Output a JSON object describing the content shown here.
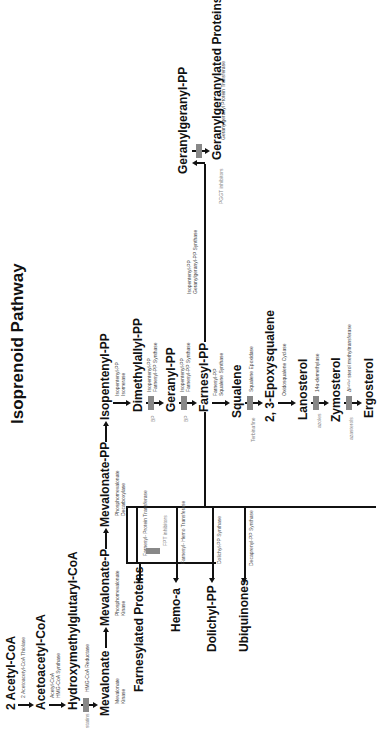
{
  "title": "Isoprenoid Pathway",
  "orientation": "rotated 90° counter-clockwise",
  "colors": {
    "text": "#111111",
    "inhibitor_text": "#888888",
    "inhibitor_block": "#888888",
    "background": "#ffffff"
  },
  "nodes": {
    "acetyl_coa": "2 Acetyl-CoA",
    "acetoacetyl_coa": "Acetoacetyl-CoA",
    "hmg_coa": "Hydroxymethylglutaryl-CoA",
    "mevalonate": "Mevalonate",
    "mevalonate_p": "Mevalonate-P",
    "mevalonate_pp": "Mevalonate-PP",
    "isopentenyl_pp": "Isopentenyl-PP",
    "dimethylallyl_pp": "Dimethylallyl-PP",
    "geranyl_pp": "Geranyl-PP",
    "farnesyl_pp": "Farnesyl-PP",
    "squalene": "Squalene",
    "epoxysqualene": "2, 3-Epoxysqualene",
    "lanosterol": "Lanosterol",
    "zymosterol": "Zymosterol",
    "ergosterol": "Ergosterol",
    "farnesylated_proteins": "Farnesylated Proteins",
    "hemo_a": "Hemo-a",
    "dolichyl_pp": "Dolichyl-PP",
    "ubiquinones": "Ubiquinones",
    "geranylgeranyl_pp": "Geranylgeranyl-PP",
    "geranylgeranylated_proteins": "Geranylgeranylated Proteins"
  },
  "enzymes": {
    "thiolase": "2 Acetoacetyl-CoA Thiolase",
    "hmg_synthase_1": "Acetyl-CoA",
    "hmg_synthase_2": "HMG-CoA Synthase",
    "hmg_reductase": "HMG-CoA Reductase",
    "mev_kinase_1": "Mevalonate",
    "mev_kinase_2": "Kinase",
    "pmev_kinase_1": "Phosphomevalonate",
    "pmev_kinase_2": "Kinase",
    "decarboxylase_1": "Phosphomevalonate",
    "decarboxylase_2": "Decarboxylase",
    "isomerase_1": "Isopentenyl-PP",
    "isomerase_2": "Isomerase",
    "fpp_synth_a1": "Isopentenyl-PP",
    "fpp_synth_a2": "Farnesyl-PP Synthase",
    "fpp_synth_b1": "Isopentenyl-PP",
    "fpp_synth_b2": "Farnesyl-PP Synthase",
    "sq_synth_1": "Farnesyl-PP",
    "sq_synth_2": "Squalene Synthase",
    "sq_epox": "Squalene Epoxidase",
    "oxidosq_cyclase": "Oxidosqualene Cyclase",
    "demethylase": "14α-demethylase",
    "methyltransferase": "Δ²⁴⁽²⁸⁾ sterol methyltransferase",
    "ftase": "Farnesyl- Protein Transferase",
    "hemo_transferase": "Farnesyl- Hemo Transferase",
    "dolichyl_synth": "Dolichyl-PP Synthase",
    "decaprenyl_synth": "Decaprenyl-PP Synthase",
    "ggpp_synth_1": "Isopentenyl-PP",
    "ggpp_synth_2": "Geranylgeranyl-PP Synthase",
    "ggt": "Geranylgeranyl Protein Transferase"
  },
  "inhibitors": {
    "statins": "statins",
    "bp1": "BP",
    "bp2": "BP",
    "terbinafine": "Terbinafine",
    "azoles": "azoles",
    "azasterols": "azasterols",
    "fpt": "FPT inhibitors",
    "pggt": "PGGT inhibitors"
  }
}
